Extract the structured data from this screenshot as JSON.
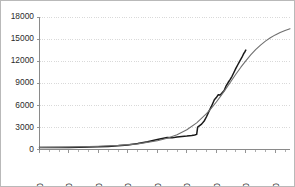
{
  "chart_data": {
    "type": "line",
    "title": "",
    "subtitle": "",
    "xlabel": "",
    "ylabel": "",
    "xlim": [
      1800,
      2055
    ],
    "ylim": [
      0,
      18000
    ],
    "grid": true,
    "legend": false,
    "legend_position": "none",
    "y_ticks": [
      0,
      3000,
      6000,
      9000,
      12000,
      15000,
      18000
    ],
    "y_tick_labels": [
      "0",
      "3000",
      "6000",
      "9000",
      "12000",
      "15000",
      "18000"
    ],
    "x_ticks": [
      1800,
      1830,
      1860,
      1890,
      1920,
      1950,
      1980,
      2010,
      2040
    ],
    "x_tick_labels": [
      "1800",
      "1830",
      "1860",
      "1890",
      "1920",
      "1950",
      "1980",
      "2010",
      "2040"
    ],
    "x_minor_tick_interval": 10,
    "series": [
      {
        "name": "observed",
        "color": "#1a1a1a",
        "x": [
          1800,
          1810,
          1820,
          1830,
          1840,
          1850,
          1860,
          1870,
          1880,
          1890,
          1900,
          1910,
          1920,
          1925,
          1930,
          1935,
          1940,
          1945,
          1950,
          1955,
          1958,
          1960,
          1961,
          1965,
          1968,
          1970,
          1972,
          1975,
          1978,
          1980,
          1982,
          1984,
          1986,
          1988,
          1990,
          1992,
          1994,
          1996,
          1998,
          2000,
          2002,
          2004,
          2006,
          2008,
          2009,
          2010
        ],
        "values": [
          260,
          255,
          258,
          262,
          300,
          340,
          360,
          420,
          500,
          620,
          800,
          1050,
          1350,
          1500,
          1620,
          1580,
          1700,
          1760,
          1820,
          1900,
          1960,
          2050,
          3050,
          3450,
          3950,
          4450,
          5050,
          5850,
          6750,
          7050,
          7450,
          7400,
          7700,
          8000,
          8650,
          9100,
          9500,
          9950,
          10500,
          11050,
          11550,
          12050,
          12500,
          13050,
          13250,
          13500
        ]
      },
      {
        "name": "fitted",
        "color": "#6f6f6f",
        "x": [
          1800,
          1820,
          1840,
          1860,
          1880,
          1900,
          1920,
          1930,
          1940,
          1950,
          1960,
          1970,
          1975,
          1980,
          1985,
          1990,
          1995,
          2000,
          2005,
          2010,
          2015,
          2020,
          2025,
          2030,
          2035,
          2040,
          2045,
          2050,
          2055
        ],
        "values": [
          290,
          320,
          370,
          440,
          560,
          760,
          1180,
          1520,
          2000,
          2680,
          3620,
          4860,
          5620,
          6450,
          7350,
          8300,
          9280,
          10250,
          11180,
          12050,
          12850,
          13560,
          14180,
          14720,
          15180,
          15570,
          15900,
          16180,
          16410
        ]
      }
    ]
  },
  "axes": {
    "y_axis_name": "y-axis",
    "x_axis_name": "x-axis"
  }
}
